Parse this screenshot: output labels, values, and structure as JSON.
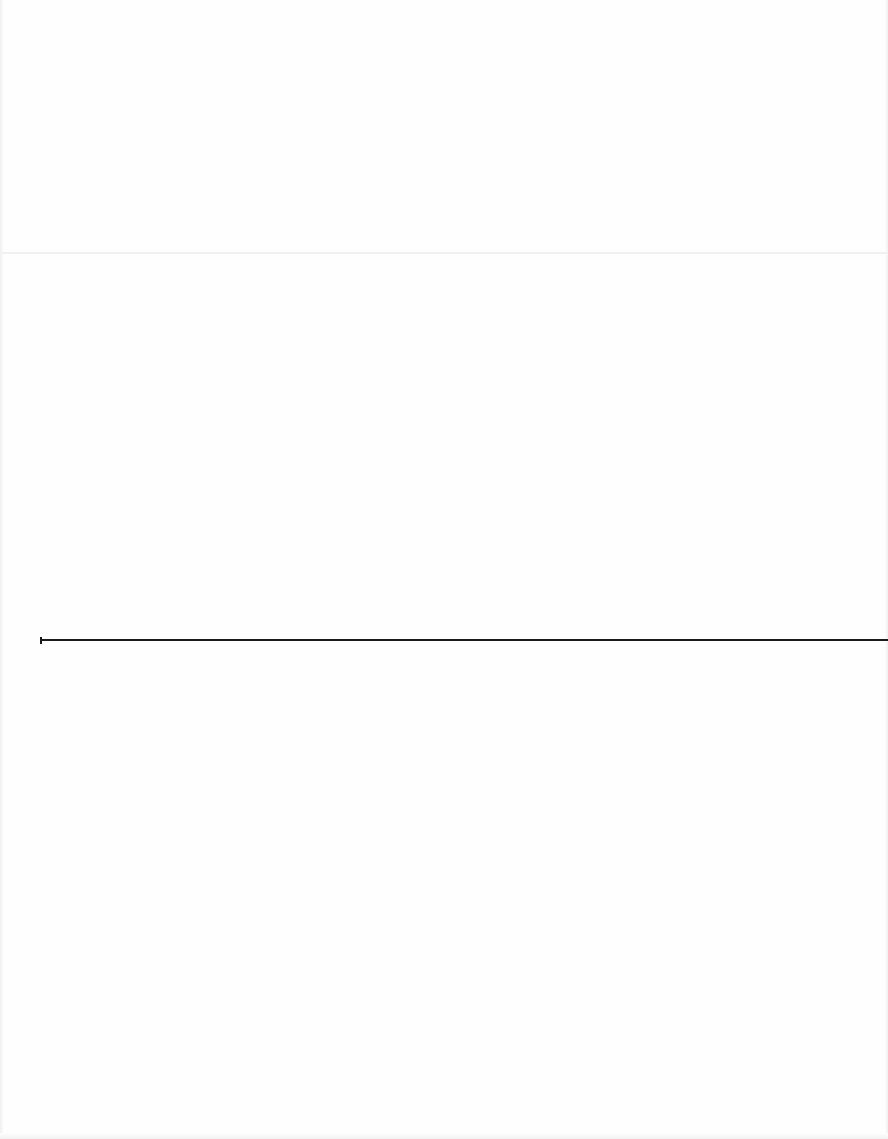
{
  "document": {
    "type": "scanned-blank-page",
    "text": "",
    "background_color": "#fefefe",
    "fold_crease": {
      "y": 252,
      "color": "#f1f1f1"
    },
    "horizontal_rule": {
      "y": 640,
      "x_start": 40,
      "x_end": 888,
      "color": "#1a1a1a",
      "start_tick": true
    }
  }
}
